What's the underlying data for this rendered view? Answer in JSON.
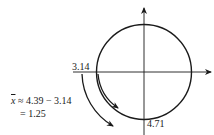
{
  "diagram": {
    "type": "unit-circle-angle",
    "labels": {
      "left_crossing": "3.14",
      "bottom_crossing": "4.71",
      "equation_var": "x",
      "equation_line1_rest": " ≈ 4.39 − 3.14",
      "equation_line2": "= 1.25"
    },
    "colors": {
      "stroke": "#1a1a1a",
      "background": "#ffffff"
    },
    "elements": [
      "horizontal-axis-with-arrow",
      "vertical-axis-with-arrow",
      "circle",
      "inner-arc-arrow",
      "outer-arc-arrow"
    ]
  }
}
